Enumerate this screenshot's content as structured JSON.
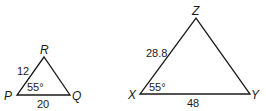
{
  "diagram": {
    "type": "similar-triangles",
    "triangles": [
      {
        "name": "triangle-PQR",
        "vertices": {
          "P": "P",
          "Q": "Q",
          "R": "R"
        },
        "sides": {
          "PR": "12",
          "PQ": "20"
        },
        "angle_P": "55°"
      },
      {
        "name": "triangle-XYZ",
        "vertices": {
          "X": "X",
          "Y": "Y",
          "Z": "Z"
        },
        "sides": {
          "XZ": "28.8",
          "XY": "48"
        },
        "angle_X": "55°"
      }
    ]
  }
}
